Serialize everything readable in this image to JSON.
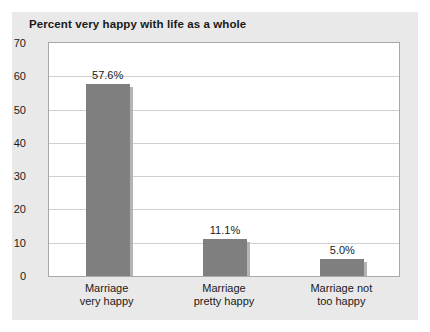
{
  "chart_data": {
    "type": "bar",
    "title": "Percent very happy with life as a whole",
    "xlabel": "",
    "ylabel": "",
    "ylim": [
      0,
      70
    ],
    "ytick_step": 10,
    "yticks": [
      70,
      60,
      50,
      40,
      30,
      20,
      10,
      0
    ],
    "grid": true,
    "legend": false,
    "categories": [
      "Marriage very happy",
      "Marriage pretty happy",
      "Marriage not too happy"
    ],
    "category_lines": [
      [
        "Marriage",
        "very happy"
      ],
      [
        "Marriage",
        "pretty happy"
      ],
      [
        "Marriage not",
        "too happy"
      ]
    ],
    "values": [
      57.6,
      11.1,
      5.0
    ],
    "data_labels": [
      "57.6%",
      "11.1%",
      "5.0%"
    ],
    "colors": {
      "bar": "#7f7f7f",
      "bar_edge": "#b4b4b4",
      "panel": "#e9e9e9",
      "plot_background": "#ffffff",
      "gridline": "#cfcfcf",
      "frame": "#a8a8a8",
      "text": "#1a1a1a"
    }
  }
}
